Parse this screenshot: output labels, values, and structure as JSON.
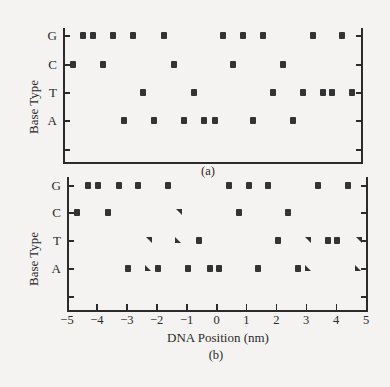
{
  "chart_data": [
    {
      "type": "scatter",
      "panel": "a",
      "caption": "(a)",
      "ylabel": "Base Type",
      "xlabel": "",
      "categories_y": [
        "G",
        "C",
        "T",
        "A"
      ],
      "xlim": [
        -5,
        5
      ],
      "grid": false,
      "series": [
        {
          "name": "G",
          "marker": "square",
          "x": [
            -4.33,
            -4.0,
            -3.32,
            -2.65,
            -1.61,
            0.37,
            1.04,
            1.71,
            3.39,
            4.36
          ]
        },
        {
          "name": "C",
          "marker": "square",
          "x": [
            -4.66,
            -3.66,
            -1.28,
            0.7,
            2.38
          ]
        },
        {
          "name": "T",
          "marker": "square",
          "x": [
            -2.32,
            -0.6,
            2.05,
            3.05,
            3.72,
            4.03,
            4.7
          ]
        },
        {
          "name": "A",
          "marker": "square",
          "x": [
            -2.95,
            -1.95,
            -0.94,
            -0.27,
            0.1,
            1.38,
            2.72
          ]
        }
      ]
    },
    {
      "type": "scatter",
      "panel": "b",
      "caption": "(b)",
      "ylabel": "Base Type",
      "xlabel": "DNA Position (nm)",
      "categories_y": [
        "G",
        "C",
        "T",
        "A"
      ],
      "xlim": [
        -5,
        5
      ],
      "xticks": [
        -5,
        -4,
        -3,
        -2,
        -1,
        0,
        1,
        2,
        3,
        4,
        5
      ],
      "grid": false,
      "series": [
        {
          "name": "G",
          "points": [
            {
              "x": -4.3,
              "m": "sq"
            },
            {
              "x": -3.96,
              "m": "sq"
            },
            {
              "x": -3.26,
              "m": "sq"
            },
            {
              "x": -2.63,
              "m": "sq"
            },
            {
              "x": -1.62,
              "m": "sq"
            },
            {
              "x": 0.42,
              "m": "sq"
            },
            {
              "x": 1.09,
              "m": "sq"
            },
            {
              "x": 1.72,
              "m": "sq"
            },
            {
              "x": 3.39,
              "m": "sq"
            },
            {
              "x": 4.4,
              "m": "sq"
            }
          ]
        },
        {
          "name": "C",
          "points": [
            {
              "x": -4.65,
              "m": "sq"
            },
            {
              "x": -3.63,
              "m": "sq"
            },
            {
              "x": -1.25,
              "m": "tri-tr"
            },
            {
              "x": 0.75,
              "m": "sq"
            },
            {
              "x": 2.39,
              "m": "sq"
            }
          ]
        },
        {
          "name": "T",
          "points": [
            {
              "x": -2.26,
              "m": "tri-tr"
            },
            {
              "x": -1.29,
              "m": "tri-bl"
            },
            {
              "x": -0.59,
              "m": "sq"
            },
            {
              "x": 2.06,
              "m": "sq"
            },
            {
              "x": 3.06,
              "m": "tri-tr"
            },
            {
              "x": 3.73,
              "m": "sq"
            },
            {
              "x": 4.03,
              "m": "sq"
            },
            {
              "x": 4.77,
              "m": "tri-tr"
            }
          ]
        },
        {
          "name": "A",
          "points": [
            {
              "x": -2.96,
              "m": "sq"
            },
            {
              "x": -2.29,
              "m": "tri-bl"
            },
            {
              "x": -1.96,
              "m": "sq"
            },
            {
              "x": -0.95,
              "m": "sq"
            },
            {
              "x": -0.22,
              "m": "sq"
            },
            {
              "x": 0.08,
              "m": "sq"
            },
            {
              "x": 1.39,
              "m": "sq"
            },
            {
              "x": 2.73,
              "m": "sq"
            },
            {
              "x": 3.06,
              "m": "tri-bl"
            },
            {
              "x": 4.74,
              "m": "tri-bl"
            }
          ]
        }
      ]
    }
  ],
  "labels": {
    "ylabel": "Base Type",
    "xlabel": "DNA Position (nm)",
    "caption_a": "(a)",
    "caption_b": "(b)",
    "rows": [
      "G",
      "C",
      "T",
      "A"
    ],
    "xticks": [
      "−5",
      "−4",
      "−3",
      "−2",
      "−1",
      "0",
      "1",
      "2",
      "3",
      "4",
      "5"
    ]
  }
}
